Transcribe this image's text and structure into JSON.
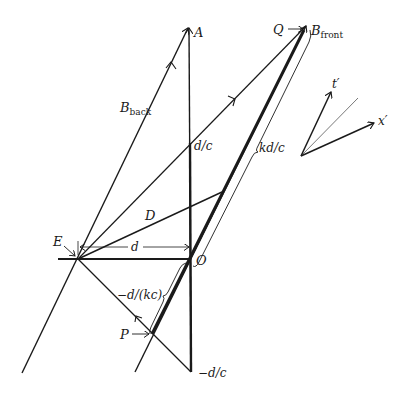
{
  "diagram": {
    "colors": {
      "stroke": "#1a1a1a",
      "background": "#ffffff",
      "thin_axis": "#555555"
    },
    "labels": {
      "A": "A",
      "Q": "Q",
      "B_front_main": "B",
      "B_front_sub": "front",
      "B_back_main": "B",
      "B_back_sub": "back",
      "d_over_c": "d/c",
      "kd_over_c": "kd/c",
      "D": "D",
      "E": "E",
      "d": "d",
      "O": "O",
      "minus_d_over_kc": "−d/(kc)",
      "P": "P",
      "minus_d_over_c": "−d/c",
      "t_prime": "t′",
      "x_prime": "x′",
      "arrow": "→"
    },
    "points": {
      "A": [
        189,
        27
      ],
      "O": [
        191,
        259
      ],
      "E": [
        78,
        259
      ],
      "Q": [
        307,
        25
      ],
      "P": [
        152,
        334
      ],
      "D": [
        222,
        192
      ],
      "d_over_c": [
        190,
        143
      ],
      "minus_d_over_c": [
        191,
        372
      ]
    }
  }
}
